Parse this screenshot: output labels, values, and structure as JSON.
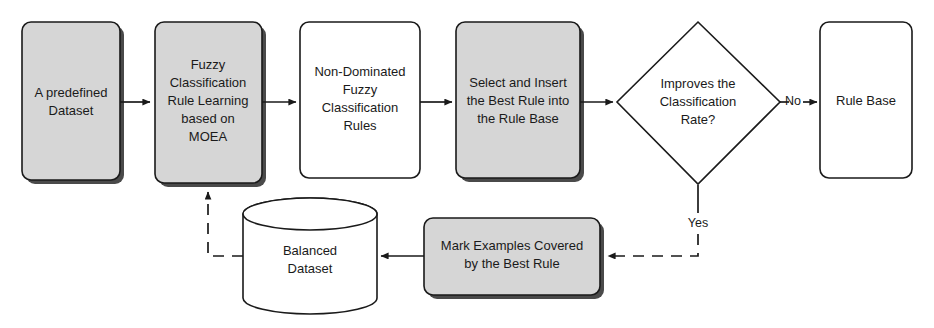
{
  "diagram": {
    "colors": {
      "process_fill": "#d6d6d6",
      "plain_fill": "#ffffff",
      "stroke": "#1a1a1a"
    },
    "nodes": [
      {
        "id": "predefined-dataset",
        "shape": "rounded-rect",
        "fill": "process_fill",
        "lines": [
          "A predefined",
          "Dataset"
        ]
      },
      {
        "id": "fuzzy-rule-learning",
        "shape": "rounded-rect",
        "fill": "process_fill",
        "lines": [
          "Fuzzy",
          "Classification",
          "Rule Learning",
          "based on",
          "MOEA"
        ]
      },
      {
        "id": "non-dominated-rules",
        "shape": "rounded-rect",
        "fill": "plain_fill",
        "lines": [
          "Non-Dominated",
          "Fuzzy",
          "Classification",
          "Rules"
        ]
      },
      {
        "id": "select-insert-best-rule",
        "shape": "rounded-rect",
        "fill": "process_fill",
        "lines": [
          "Select and Insert",
          "the Best Rule into",
          "the Rule Base"
        ]
      },
      {
        "id": "improves-classification-rate",
        "shape": "diamond",
        "fill": "plain_fill",
        "lines": [
          "Improves the",
          "Classification",
          "Rate?"
        ]
      },
      {
        "id": "rule-base",
        "shape": "rounded-rect",
        "fill": "plain_fill",
        "lines": [
          "Rule Base"
        ]
      },
      {
        "id": "balanced-dataset",
        "shape": "cylinder",
        "fill": "plain_fill",
        "lines": [
          "Balanced",
          "Dataset"
        ]
      },
      {
        "id": "mark-examples-covered",
        "shape": "rounded-rect",
        "fill": "process_fill",
        "lines": [
          "Mark Examples Covered",
          "by the Best Rule"
        ]
      }
    ],
    "edge_labels": {
      "no": "No",
      "yes": "Yes"
    }
  }
}
